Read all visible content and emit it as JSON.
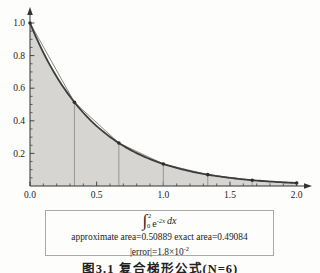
{
  "chart_data": {
    "type": "area",
    "title": "",
    "function_label": "e^(-2x)",
    "rate": -2,
    "x_range": [
      0,
      2
    ],
    "y_range": [
      0,
      1
    ],
    "grid": false,
    "legend": false,
    "x_ticks": {
      "values": [
        0,
        0.5,
        1.0,
        1.5,
        2.0
      ],
      "labels": [
        "0.0",
        "0.5",
        "1.0",
        "1.5",
        "2.0"
      ]
    },
    "y_ticks": {
      "values": [
        0.2,
        0.4,
        0.6,
        0.8,
        1.0
      ],
      "labels": [
        "0.2",
        "0.4",
        "0.6",
        "0.8",
        "1.0"
      ]
    },
    "x_minor_step": 0.1,
    "y_minor_step": 0.05,
    "n_intervals": 6,
    "nodes": {
      "x": [
        0,
        0.33333,
        0.66667,
        1.0,
        1.33333,
        1.66667,
        2.0
      ],
      "y": [
        1.0,
        0.51342,
        0.2636,
        0.13534,
        0.06948,
        0.03567,
        0.01832
      ]
    },
    "approximate_area": 0.50889,
    "exact_area": 0.49084,
    "abs_error": "1.8e-2",
    "colors": {
      "fill": "#d6d5d1",
      "curve": "#3d3d3d",
      "chord": "#6a6a6a",
      "node_line": "#979797",
      "dot": "#2e2e2e",
      "axis": "#333333",
      "label": "#222222"
    }
  },
  "annotation_box": {
    "integral": {
      "sign": "∫",
      "upper": "2",
      "lower": "0",
      "base": "e",
      "exponent": "-2x",
      "differential": "dx"
    },
    "line2": "approximate area=0.50889 exact area=0.49084",
    "error_prefix": "|error|=1.8×10",
    "error_exponent": "-2"
  },
  "caption": "图3.1 复合梯形公式(N=6)"
}
